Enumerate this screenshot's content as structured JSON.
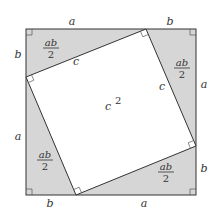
{
  "diagram": {
    "colors": {
      "triangle_fill": "#d6d6d6",
      "square_fill": "#ffffff",
      "stroke": "#333333"
    },
    "outer_square": {
      "x": 26,
      "y": 29,
      "size": 170
    },
    "inner_square_vertices": [
      [
        146,
        29
      ],
      [
        196,
        146
      ],
      [
        76,
        195
      ],
      [
        26,
        77
      ]
    ],
    "side_labels": {
      "top_a": "a",
      "top_b": "b",
      "right_a": "a",
      "right_b": "b",
      "bottom_b": "b",
      "bottom_a": "a",
      "left_b": "b",
      "left_a": "a"
    },
    "hypotenuse_labels": {
      "top_left": "c",
      "top_right": "c"
    },
    "triangle_area": {
      "numerator": "ab",
      "denominator": "2"
    },
    "inner_area": {
      "base": "c",
      "exponent": "2"
    }
  }
}
